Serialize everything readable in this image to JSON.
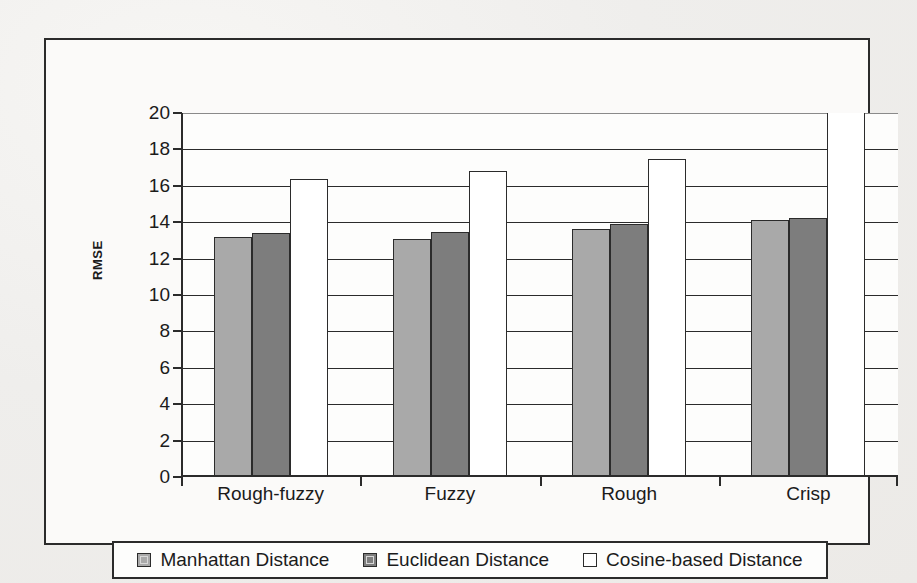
{
  "chart_data": {
    "type": "bar",
    "title": "",
    "xlabel": "",
    "ylabel": "RMSE",
    "ylim": [
      0,
      20
    ],
    "ytick_step": 2,
    "grid": "horizontal",
    "legend_position": "bottom",
    "categories": [
      "Rough-fuzzy",
      "Fuzzy",
      "Rough",
      "Crisp"
    ],
    "yticks": [
      "20",
      "18",
      "16",
      "14",
      "12",
      "10",
      "8",
      "6",
      "4",
      "2",
      "0"
    ],
    "series": [
      {
        "name": "Manhattan Distance",
        "color": "#a9a9a9",
        "values": [
          13.2,
          13.1,
          13.6,
          14.1
        ]
      },
      {
        "name": "Euclidean Distance",
        "color": "#7d7d7d",
        "values": [
          13.4,
          13.45,
          13.9,
          14.25
        ]
      },
      {
        "name": "Cosine-based Distance",
        "color": "#ffffff",
        "values": [
          16.35,
          16.8,
          17.45,
          20.6
        ]
      }
    ]
  },
  "legend": {
    "items": [
      {
        "label": "Manhattan Distance"
      },
      {
        "label": "Euclidean Distance"
      },
      {
        "label": "Cosine-based Distance"
      }
    ]
  }
}
